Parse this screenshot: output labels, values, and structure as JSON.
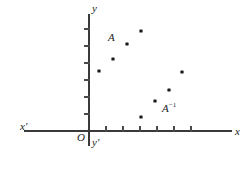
{
  "figure": {
    "width": 247,
    "height": 169,
    "background": "#ffffff",
    "ink_color": "#1a1a1a",
    "axis_color": "#3a3a3a"
  },
  "axes": {
    "origin_label": "O",
    "x_positive_label": "x",
    "x_negative_label": "x'",
    "y_positive_label": "y",
    "y_negative_label": "y'",
    "origin_px": {
      "x": 89,
      "y": 131
    },
    "x_axis_px": {
      "x1": 24,
      "x2": 232,
      "y": 131
    },
    "y_axis_px": {
      "x": 89,
      "y1": 14,
      "y2": 146
    },
    "tick_spacing_px": 17,
    "x_ticks_px": [
      106,
      123,
      140,
      157,
      174,
      191
    ],
    "y_ticks_px": [
      114,
      97,
      80,
      63,
      46,
      29
    ],
    "tick_length_px": 5,
    "grid": false
  },
  "chart_data": {
    "type": "scatter",
    "title": "",
    "xlabel": "x",
    "ylabel": "y",
    "xlim": [
      -4,
      9
    ],
    "ylim": [
      -1,
      7
    ],
    "grid": false,
    "legend": "none",
    "annotations": [
      {
        "text": "A",
        "x_px": 113,
        "y_px": 38
      },
      {
        "text": "A^-1",
        "display": "A⁻¹",
        "x_px": 168,
        "y_px": 109
      }
    ],
    "series": [
      {
        "name": "A",
        "label": "A",
        "marker": "square-dot",
        "points_px": [
          {
            "x": 99,
            "y": 71
          },
          {
            "x": 113,
            "y": 59
          },
          {
            "x": 127,
            "y": 44
          },
          {
            "x": 141,
            "y": 31
          }
        ],
        "points_data": [
          {
            "x": 0.6,
            "y": 3.5
          },
          {
            "x": 1.4,
            "y": 4.2
          },
          {
            "x": 2.2,
            "y": 5.1
          },
          {
            "x": 3.1,
            "y": 5.9
          }
        ]
      },
      {
        "name": "A-inverse",
        "label": "A⁻¹",
        "marker": "square-dot",
        "points_px": [
          {
            "x": 141,
            "y": 117
          },
          {
            "x": 155,
            "y": 101
          },
          {
            "x": 169,
            "y": 90
          },
          {
            "x": 182,
            "y": 72
          }
        ],
        "points_data": [
          {
            "x": 3.1,
            "y": 0.8
          },
          {
            "x": 3.9,
            "y": 1.8
          },
          {
            "x": 4.7,
            "y": 2.4
          },
          {
            "x": 5.5,
            "y": 3.5
          }
        ]
      }
    ]
  }
}
